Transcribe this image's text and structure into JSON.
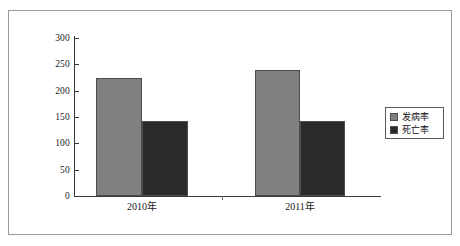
{
  "figure": {
    "background_color": "#ffffff",
    "frame_color": "#9a9a9a",
    "axis_color": "#3a3a3a"
  },
  "legend": {
    "position": "right",
    "entries": [
      {
        "label": "发病率",
        "color": "#808080",
        "swatch_name": "legend-swatch-incidence"
      },
      {
        "label": "死亡率",
        "color": "#2a2a2a",
        "swatch_name": "legend-swatch-mortality"
      }
    ]
  },
  "chart_data": {
    "type": "bar",
    "title": "",
    "subtitle": "",
    "xlabel": "",
    "ylabel": "",
    "categories": [
      "2010年",
      "2011年"
    ],
    "series": [
      {
        "name": "发病率",
        "color": "#808080",
        "values": [
          225,
          240
        ]
      },
      {
        "name": "死亡率",
        "color": "#2a2a2a",
        "values": [
          142,
          142
        ]
      }
    ],
    "ylim": [
      0,
      300
    ],
    "yticks": [
      0,
      50,
      100,
      150,
      200,
      250,
      300
    ],
    "ytick_labels": [
      "0",
      "50",
      "100",
      "150",
      "200",
      "250",
      "300"
    ],
    "grid": false,
    "legend_position": "right",
    "annotations": []
  }
}
